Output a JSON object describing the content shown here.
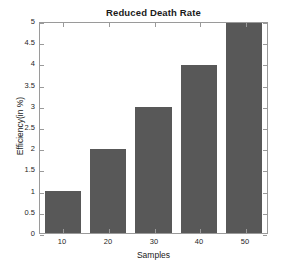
{
  "chart_data": {
    "type": "bar",
    "title": "Reduced Death Rate",
    "xlabel": "Samples",
    "ylabel": "Efficiency(in %)",
    "categories": [
      "10",
      "20",
      "30",
      "40",
      "50"
    ],
    "values": [
      1,
      2,
      3,
      4,
      5
    ],
    "series": [
      {
        "name": "Efficiency",
        "values": [
          1,
          2,
          3,
          4,
          5
        ]
      }
    ],
    "ylim": [
      0,
      5
    ],
    "yticks": [
      0,
      0.5,
      1,
      1.5,
      2,
      2.5,
      3,
      3.5,
      4,
      4.5,
      5
    ],
    "ytick_labels": [
      "0",
      "0.5",
      "1",
      "1.5",
      "2",
      "2.5",
      "3",
      "3.5",
      "4",
      "4.5",
      "5"
    ],
    "xtick_labels": [
      "10",
      "20",
      "30",
      "40",
      "50"
    ],
    "grid": false,
    "legend": null,
    "bar_color": "#585858",
    "axis_color": "#9a9a9a",
    "background": "#ffffff",
    "bar_width_ratio": 0.8
  }
}
